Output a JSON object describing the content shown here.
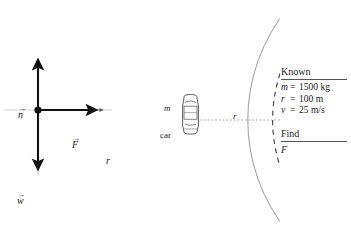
{
  "figure": {
    "type": "physics-diagram"
  },
  "free_body_diagram": {
    "origin_dot": "particle",
    "axis_label": "r",
    "vectors": [
      {
        "id": "normal",
        "symbol": "n",
        "hat": "→",
        "direction": "up",
        "label_position": "upper-left"
      },
      {
        "id": "force",
        "symbol": "F",
        "hat": "→",
        "direction": "right",
        "label_position": "above-right"
      },
      {
        "id": "weight",
        "symbol": "w",
        "hat": "→",
        "direction": "down",
        "label_position": "lower-left"
      }
    ]
  },
  "road_scene": {
    "mass_label": "m",
    "object_label": "car",
    "radius_label": "r",
    "arcs": [
      {
        "id": "outer-edge",
        "style": "solid"
      },
      {
        "id": "center-line",
        "style": "dashed"
      },
      {
        "id": "inner-edge",
        "style": "solid"
      }
    ],
    "radius_line_style": "dotted"
  },
  "panel": {
    "known_heading": "Known",
    "known_rows": [
      {
        "symbol": "m",
        "eq": "=",
        "value": "1500 kg"
      },
      {
        "symbol": "r",
        "eq": "=",
        "value": "100 m"
      },
      {
        "symbol": "v",
        "eq": "=",
        "value": "25 m/s"
      }
    ],
    "find_heading": "Find",
    "find_value": "F"
  },
  "colors": {
    "ink": "#1a1a1a",
    "vector": "#111111",
    "road_line": "#7a7a7a",
    "rule": "#555555",
    "car_body": "#ffffff",
    "car_outline": "#4a4a4a"
  }
}
